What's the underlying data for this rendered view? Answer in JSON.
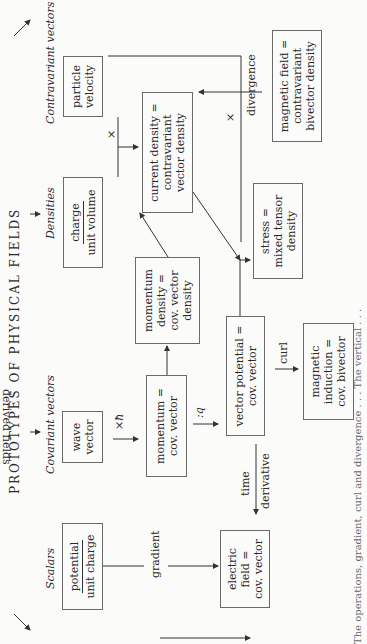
{
  "title": "PROTOTYPES OF PHYSICAL FIELDS",
  "categories": {
    "scalars": "Scalars",
    "covariant": "Covariant vectors",
    "densities": "Densities",
    "contravariant": "Contravariant vectors"
  },
  "boxes": {
    "potential": {
      "num": "potential",
      "den": "unit charge"
    },
    "wave_vector": [
      "wave",
      "vector"
    ],
    "charge": {
      "num": "charge",
      "den": "unit volume"
    },
    "particle_velocity": [
      "particle",
      "velocity"
    ],
    "electric_field": [
      "electric",
      "field =",
      "cov. vector"
    ],
    "momentum": [
      "momentum =",
      "cov. vector"
    ],
    "momentum_density": [
      "momentum",
      "density =",
      "cov. vector",
      "density"
    ],
    "current_density": [
      "current density =",
      "contravariant",
      "vector density"
    ],
    "vector_potential": [
      "vector potential =",
      "cov. vector"
    ],
    "stress": [
      "stress =",
      "mixed tensor",
      "density"
    ],
    "magnetic_induction": [
      "magnetic",
      "induction =",
      "cov. bivector"
    ],
    "magnetic_field": [
      "magnetic field =",
      "contravariant",
      "bivector density"
    ]
  },
  "edge_labels": {
    "gradient": "gradient",
    "time": "time",
    "derivative": "derivative",
    "x_hbar": "×ħ",
    "div_q": ":q",
    "curl": "curl",
    "divergence": "divergence",
    "x1": "×",
    "x2": "×"
  },
  "side_label": "derived fields",
  "caption": "The operations, gradient, curl and divergence . . . The vertical . . ."
}
